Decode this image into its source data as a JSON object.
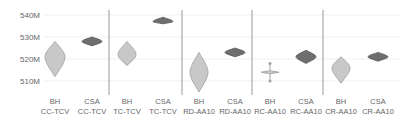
{
  "chart_data": {
    "type": "violin",
    "title": "",
    "xlabel": "",
    "ylabel": "",
    "ylim": [
      503,
      542
    ],
    "y_ticks": [
      510,
      520,
      530,
      540
    ],
    "y_tick_labels": [
      "510M",
      "520M",
      "530M",
      "540M"
    ],
    "grid": true,
    "legend": "none",
    "groups": [
      "CC-TCV",
      "TC-TCV",
      "RD-AA10",
      "RC-AA10",
      "CR-AA10"
    ],
    "categories": [
      {
        "line1": "BH",
        "line2": "CC-TCV"
      },
      {
        "line1": "CSA",
        "line2": "CC-TCV"
      },
      {
        "line1": "BH",
        "line2": "TC-TCV"
      },
      {
        "line1": "CSA",
        "line2": "TC-TCV"
      },
      {
        "line1": "BH",
        "line2": "RD-AA10"
      },
      {
        "line1": "CSA",
        "line2": "RD-AA10"
      },
      {
        "line1": "BH",
        "line2": "RC-AA10"
      },
      {
        "line1": "CSA",
        "line2": "RC-AA10"
      },
      {
        "line1": "BH",
        "line2": "CR-AA10"
      },
      {
        "line1": "CSA",
        "line2": "CR-AA10"
      }
    ],
    "series": [
      {
        "name": "BH CC-TCV",
        "method": "BH",
        "min": 512,
        "max": 528,
        "median": 521,
        "halfwidth": 10,
        "color": "#c8c8c8"
      },
      {
        "name": "CSA CC-TCV",
        "method": "CSA",
        "min": 526,
        "max": 530,
        "median": 528,
        "halfwidth": 10,
        "color": "#6e6e6e"
      },
      {
        "name": "BH TC-TCV",
        "method": "BH",
        "min": 517,
        "max": 528,
        "median": 522,
        "halfwidth": 9,
        "color": "#c8c8c8"
      },
      {
        "name": "CSA TC-TCV",
        "method": "CSA",
        "min": 536,
        "max": 539,
        "median": 537,
        "halfwidth": 10,
        "color": "#6e6e6e"
      },
      {
        "name": "BH RD-AA10",
        "method": "BH",
        "min": 505,
        "max": 523,
        "median": 514,
        "halfwidth": 9,
        "color": "#c8c8c8"
      },
      {
        "name": "CSA RD-AA10",
        "method": "CSA",
        "min": 521,
        "max": 525,
        "median": 523,
        "halfwidth": 10,
        "color": "#6e6e6e"
      },
      {
        "name": "BH RC-AA10",
        "method": "BH",
        "min": 510,
        "max": 518,
        "median": 514,
        "halfwidth": 9,
        "color": "#c8c8c8"
      },
      {
        "name": "CSA RC-AA10",
        "method": "CSA",
        "min": 518,
        "max": 524,
        "median": 521,
        "halfwidth": 10,
        "color": "#6e6e6e"
      },
      {
        "name": "BH CR-AA10",
        "method": "BH",
        "min": 509,
        "max": 521,
        "median": 516,
        "halfwidth": 9,
        "color": "#c8c8c8"
      },
      {
        "name": "CSA CR-AA10",
        "method": "CSA",
        "min": 519,
        "max": 523,
        "median": 521,
        "halfwidth": 10,
        "color": "#6e6e6e"
      }
    ]
  },
  "layout": {
    "plot_left": 44,
    "plot_right": 400,
    "y_px_at_540": 15,
    "y_px_per_10": 22,
    "centers": [
      55,
      92,
      127,
      163,
      199,
      235,
      270,
      306,
      341,
      378
    ],
    "separators": [
      109,
      182,
      252,
      323
    ],
    "separator_top": 10,
    "separator_bottom": 95,
    "label_line1_y": 104,
    "label_line2_y": 114
  },
  "colors": {
    "gridline": "#efefef",
    "separator": "#9a9a9a",
    "tick_text": "#666666",
    "bh_fill": "#c8c8c8",
    "bh_stroke": "#a0a0a0",
    "csa_fill": "#6e6e6e",
    "csa_stroke": "#555555"
  }
}
